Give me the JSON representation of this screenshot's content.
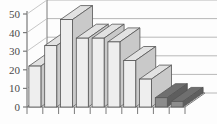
{
  "chart_data": {
    "type": "bar",
    "title": "",
    "subtitle": "",
    "xlabel": "",
    "ylabel": "",
    "categories": [
      "1",
      "2",
      "3",
      "4",
      "5",
      "6",
      "7",
      "8",
      "9",
      "10"
    ],
    "values": [
      22,
      33,
      47,
      37,
      37,
      35,
      25,
      15,
      5,
      3
    ],
    "series": [
      {
        "name": "",
        "values": [
          22,
          33,
          47,
          37,
          37,
          35,
          25,
          15,
          5,
          3
        ]
      }
    ],
    "ylim": [
      0,
      50
    ],
    "y_ticks": [
      0,
      10,
      20,
      30,
      40,
      50
    ],
    "y_tick_labels": [
      "0",
      "10",
      "20",
      "30",
      "40",
      "50"
    ],
    "x_tick_labels": [
      "",
      "",
      "",
      "",
      "",
      "",
      "",
      "",
      "",
      ""
    ],
    "grid": true,
    "grid_axis": "y",
    "legend": false,
    "legend_position": "none",
    "style": "3d-bar",
    "bar_colors": [
      "#eeeeee",
      "#eeeeee",
      "#eeeeee",
      "#eeeeee",
      "#eeeeee",
      "#eeeeee",
      "#eeeeee",
      "#eeeeee",
      "#8c8c8c",
      "#8c8c8c"
    ],
    "bar_top_colors": [
      "#e2e2e2",
      "#e2e2e2",
      "#e2e2e2",
      "#e2e2e2",
      "#e2e2e2",
      "#e2e2e2",
      "#e2e2e2",
      "#e2e2e2",
      "#6f6f6f",
      "#6f6f6f"
    ],
    "bar_side_colors": [
      "#c9c9c9",
      "#c9c9c9",
      "#c9c9c9",
      "#c9c9c9",
      "#c9c9c9",
      "#c9c9c9",
      "#c9c9c9",
      "#c9c9c9",
      "#5e5e5e",
      "#5e5e5e"
    ],
    "colors": {
      "axis": "#7a7a7a",
      "grid": "#b8b8b8",
      "outline": "#555555",
      "background": "#fdfdfd",
      "tick_text": "#4a4a4a",
      "highlight": "#8c8c8c"
    },
    "annotations": []
  }
}
